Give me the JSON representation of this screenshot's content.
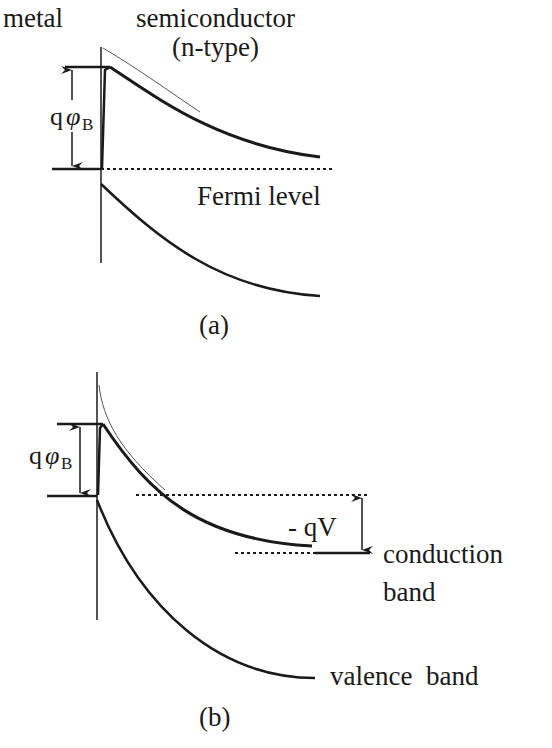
{
  "figure": {
    "panel_a": {
      "caption": "(a)",
      "labels": {
        "metal": "metal",
        "semiconductor": "semiconductor",
        "type": "(n-type)",
        "barrier_q": "q",
        "barrier_phi": "φ",
        "barrier_sub": "B",
        "fermi": "Fermi level"
      }
    },
    "panel_b": {
      "caption": "(b)",
      "labels": {
        "barrier_q": "q",
        "barrier_phi": "φ",
        "barrier_sub": "B",
        "bias": "- qV",
        "conduction1": "conduction",
        "conduction2": "band",
        "valence": "valence  band"
      }
    },
    "colors": {
      "ink": "#1a1a1a",
      "background": "#ffffff"
    }
  }
}
